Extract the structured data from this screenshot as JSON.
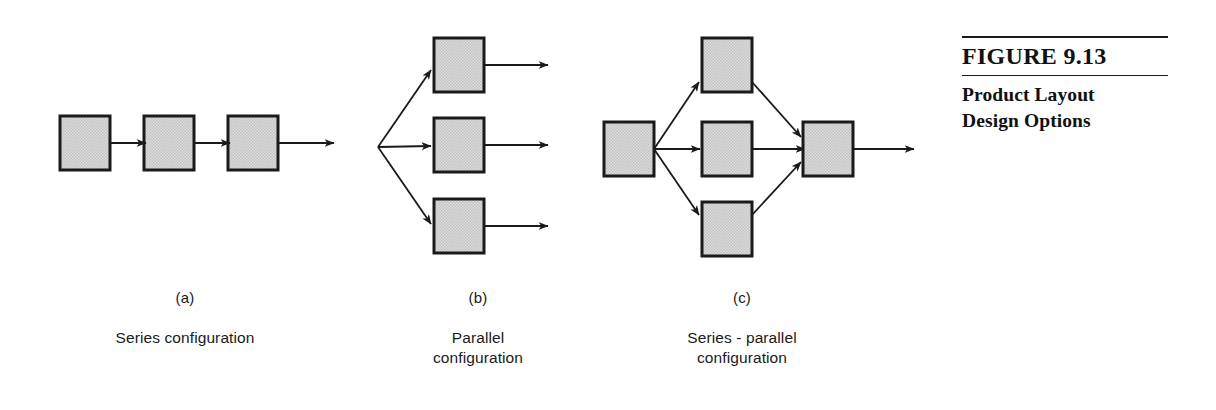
{
  "figure": {
    "number_label": "FIGURE 9.13",
    "title": "Product Layout\nDesign Options"
  },
  "panels": [
    {
      "letter": "(a)",
      "title": "Series configuration",
      "type": "series",
      "box_count": 3
    },
    {
      "letter": "(b)",
      "title": "Parallel\nconfiguration",
      "type": "parallel",
      "box_count": 3
    },
    {
      "letter": "(c)",
      "title": "Series - parallel\nconfiguration",
      "type": "series-parallel",
      "box_count": 5
    }
  ],
  "style": {
    "box_fill": "#d6d6d6",
    "box_stroke": "#1a1a1a",
    "arrow_color": "#1a1a1a",
    "page_background": "#ffffff",
    "text_color": "#1a1a1a"
  },
  "diagram_geometry": {
    "box_width": 50,
    "box_height": 54,
    "panel_a": {
      "boxes": [
        {
          "x": 60,
          "y": 116
        },
        {
          "x": 144,
          "y": 116
        },
        {
          "x": 228,
          "y": 116
        }
      ],
      "arrows": [
        {
          "x1": 110,
          "y1": 143,
          "x2": 144,
          "y2": 143
        },
        {
          "x1": 194,
          "y1": 143,
          "x2": 228,
          "y2": 143
        },
        {
          "x1": 278,
          "y1": 143,
          "x2": 332,
          "y2": 143
        }
      ]
    },
    "panel_b": {
      "fan_origin": {
        "x": 378,
        "y": 147
      },
      "boxes": [
        {
          "x": 434,
          "y": 38
        },
        {
          "x": 434,
          "y": 118
        },
        {
          "x": 434,
          "y": 199
        }
      ],
      "in_arrows": [
        {
          "x1": 378,
          "y1": 147,
          "x2": 428,
          "y2": 72
        },
        {
          "x1": 378,
          "y1": 147,
          "x2": 428,
          "y2": 145
        },
        {
          "x1": 378,
          "y1": 147,
          "x2": 428,
          "y2": 222
        }
      ],
      "out_arrows": [
        {
          "x1": 484,
          "y1": 65,
          "x2": 546,
          "y2": 65
        },
        {
          "x1": 484,
          "y1": 145,
          "x2": 546,
          "y2": 145
        },
        {
          "x1": 484,
          "y1": 226,
          "x2": 546,
          "y2": 226
        }
      ]
    },
    "panel_c": {
      "input_box": {
        "x": 604,
        "y": 122
      },
      "parallel_boxes": [
        {
          "x": 702,
          "y": 38
        },
        {
          "x": 702,
          "y": 122
        },
        {
          "x": 702,
          "y": 202
        }
      ],
      "output_box": {
        "x": 803,
        "y": 122
      },
      "fan_out_arrows": [
        {
          "x1": 654,
          "y1": 149,
          "x2": 697,
          "y2": 85
        },
        {
          "x1": 654,
          "y1": 149,
          "x2": 697,
          "y2": 149
        },
        {
          "x1": 654,
          "y1": 149,
          "x2": 697,
          "y2": 212
        }
      ],
      "converge_arrows": [
        {
          "x1": 752,
          "y1": 85,
          "x2": 799,
          "y2": 140
        },
        {
          "x1": 752,
          "y1": 149,
          "x2": 799,
          "y2": 149
        },
        {
          "x1": 752,
          "y1": 212,
          "x2": 799,
          "y2": 160
        }
      ],
      "exit_arrow": {
        "x1": 853,
        "y1": 149,
        "x2": 912,
        "y2": 149
      }
    }
  }
}
